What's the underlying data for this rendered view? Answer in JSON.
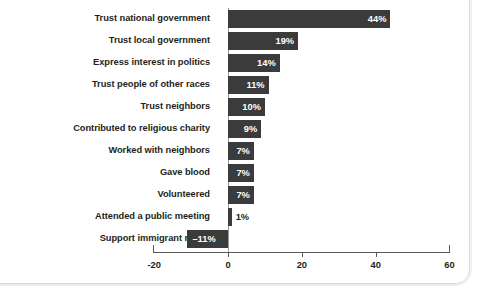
{
  "chart_data": {
    "type": "bar",
    "orientation": "horizontal",
    "title": "",
    "subtitle": "",
    "xlabel": "",
    "ylabel": "",
    "xlim": [
      -20,
      60
    ],
    "xticks": [
      -20,
      0,
      20,
      40,
      60
    ],
    "xtick_labels": [
      "-20",
      "0",
      "20",
      "40",
      "60"
    ],
    "grid": false,
    "legend": "none",
    "bar_color": "#3b3b3b",
    "value_label_color_inside": "#ffffff",
    "value_label_color_outside": "#231f20",
    "axis_color": "#58595b",
    "background": "#ffffff",
    "categories": [
      "Trust national government",
      "Trust local government",
      "Express interest in politics",
      "Trust people of other races",
      "Trust neighbors",
      "Contributed to religious charity",
      "Worked with neighbors",
      "Gave blood",
      "Volunteered",
      "Attended a public meeting",
      "Support immigrant rights"
    ],
    "values": [
      44,
      19,
      14,
      11,
      10,
      9,
      7,
      7,
      7,
      1,
      -11
    ],
    "value_labels": [
      "44%",
      "19%",
      "14%",
      "11%",
      "10%",
      "9%",
      "7%",
      "7%",
      "7%",
      "1%",
      "–11%"
    ],
    "bars": [
      {
        "category": "Trust national government",
        "value": 44,
        "label": "44%",
        "label_position": "inside-right"
      },
      {
        "category": "Trust local government",
        "value": 19,
        "label": "19%",
        "label_position": "inside-right"
      },
      {
        "category": "Express interest in politics",
        "value": 14,
        "label": "14%",
        "label_position": "inside-right"
      },
      {
        "category": "Trust people of other races",
        "value": 11,
        "label": "11%",
        "label_position": "inside-right"
      },
      {
        "category": "Trust neighbors",
        "value": 10,
        "label": "10%",
        "label_position": "inside-right"
      },
      {
        "category": "Contributed to religious charity",
        "value": 9,
        "label": "9%",
        "label_position": "inside-right"
      },
      {
        "category": "Worked with neighbors",
        "value": 7,
        "label": "7%",
        "label_position": "inside-right"
      },
      {
        "category": "Gave blood",
        "value": 7,
        "label": "7%",
        "label_position": "inside-right"
      },
      {
        "category": "Volunteered",
        "value": 7,
        "label": "7%",
        "label_position": "inside-right"
      },
      {
        "category": "Attended a public meeting",
        "value": 1,
        "label": "1%",
        "label_position": "outside"
      },
      {
        "category": "Support immigrant rights",
        "value": -11,
        "label": "–11%",
        "label_position": "inside-left"
      }
    ]
  }
}
